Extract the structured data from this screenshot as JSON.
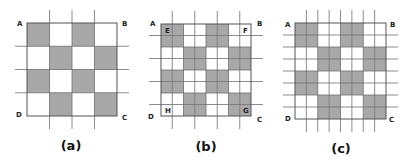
{
  "colors": {
    "shaded": "#a8a8a8",
    "border": "#555555",
    "extended_line": "#6f6f6f",
    "background": "#ffffff"
  },
  "panels": [
    {
      "id": "a",
      "caption": "(a)",
      "box": {
        "x": 27,
        "y": 23,
        "w": 90,
        "h": 93
      },
      "grid": 4,
      "subgrid": 4,
      "extended_lines": "interior-4",
      "pattern": [
        [
          1,
          0,
          1,
          0
        ],
        [
          0,
          1,
          0,
          1
        ],
        [
          1,
          0,
          1,
          0
        ],
        [
          0,
          1,
          0,
          1
        ]
      ],
      "corners": {
        "A": "A",
        "B": "B",
        "C": "C",
        "D": "D"
      },
      "inner_labels": []
    },
    {
      "id": "b",
      "caption": "(b)",
      "box": {
        "x": 161,
        "y": 24,
        "w": 90,
        "h": 92
      },
      "grid": 8,
      "subgrid": 8,
      "extended_lines": "odd-of-8",
      "pattern": [
        [
          1,
          1,
          0,
          0,
          1,
          1,
          0,
          0
        ],
        [
          1,
          1,
          0,
          0,
          1,
          1,
          0,
          0
        ],
        [
          0,
          0,
          1,
          1,
          0,
          0,
          1,
          1
        ],
        [
          0,
          0,
          1,
          1,
          0,
          0,
          1,
          1
        ],
        [
          1,
          1,
          0,
          0,
          1,
          1,
          0,
          0
        ],
        [
          1,
          1,
          0,
          0,
          1,
          1,
          0,
          0
        ],
        [
          0,
          0,
          1,
          1,
          0,
          0,
          1,
          1
        ],
        [
          0,
          0,
          1,
          1,
          0,
          0,
          1,
          1
        ]
      ],
      "corners": {
        "A": "A",
        "B": "B",
        "C": "C",
        "D": "D"
      },
      "inner_labels": [
        {
          "text": "E",
          "cell": [
            0,
            0
          ]
        },
        {
          "text": "F",
          "cell": [
            0,
            7
          ]
        },
        {
          "text": "H",
          "cell": [
            7,
            0
          ]
        },
        {
          "text": "G",
          "cell": [
            7,
            7
          ]
        }
      ]
    },
    {
      "id": "c",
      "caption": "(c)",
      "box": {
        "x": 295,
        "y": 23,
        "w": 91,
        "h": 96
      },
      "grid": 8,
      "subgrid": 8,
      "extended_lines": "all-of-8",
      "pattern": [
        [
          1,
          1,
          0,
          0,
          1,
          1,
          0,
          0
        ],
        [
          1,
          1,
          0,
          0,
          1,
          1,
          0,
          0
        ],
        [
          0,
          0,
          1,
          1,
          0,
          0,
          1,
          1
        ],
        [
          0,
          0,
          1,
          1,
          0,
          0,
          1,
          1
        ],
        [
          1,
          1,
          0,
          0,
          1,
          1,
          0,
          0
        ],
        [
          1,
          1,
          0,
          0,
          1,
          1,
          0,
          0
        ],
        [
          0,
          0,
          1,
          1,
          0,
          0,
          1,
          1
        ],
        [
          0,
          0,
          1,
          1,
          0,
          0,
          1,
          1
        ]
      ],
      "corners": {
        "A": "A",
        "B": "B",
        "C": "C",
        "D": "D"
      },
      "inner_labels": []
    }
  ]
}
